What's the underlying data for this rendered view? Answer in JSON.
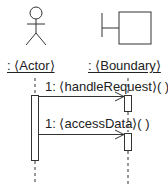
{
  "diagram": {
    "type": "UML sequence diagram",
    "participants": [
      {
        "id": "actor",
        "kind": "actor",
        "label": ": ⟨Actor⟩"
      },
      {
        "id": "boundary",
        "kind": "boundary",
        "label": ": ⟨Boundary⟩"
      }
    ],
    "messages": [
      {
        "from": "actor",
        "to": "boundary",
        "label": "1: ⟨handleRequest⟩( )"
      },
      {
        "from": "actor",
        "to": "boundary",
        "label": "1: ⟨accessData⟩( )"
      }
    ],
    "colors": {
      "line": "#333333",
      "background": "#ffffff"
    }
  }
}
